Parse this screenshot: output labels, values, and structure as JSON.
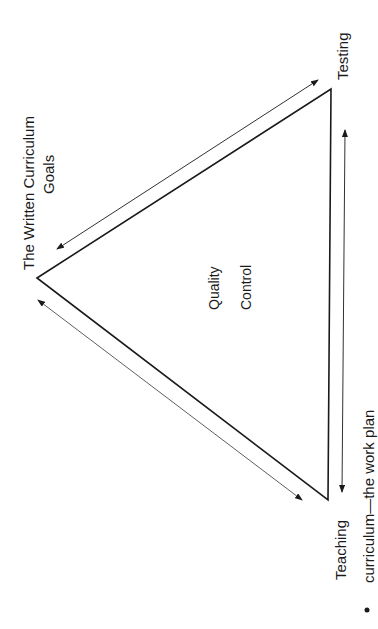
{
  "diagram": {
    "vertices": {
      "goals": {
        "line1": "The Written Curriculum",
        "line2": "Goals"
      },
      "testing": {
        "label": "Testing"
      },
      "teaching": {
        "label": "Teaching"
      }
    },
    "center": {
      "line1": "Quality",
      "line2": "Control"
    },
    "bullet": {
      "text": "curriculum—the work plan"
    },
    "colors": {
      "line": "#1a1a1a",
      "background": "#ffffff"
    }
  }
}
